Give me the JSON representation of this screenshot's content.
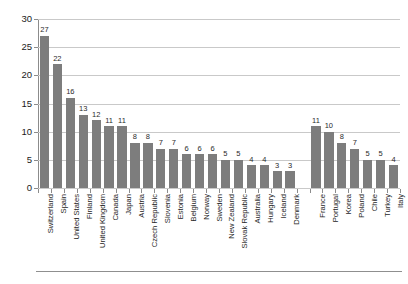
{
  "chart_data": {
    "type": "bar",
    "title": "",
    "subtitle": "",
    "xlabel": "",
    "ylabel": "",
    "ylim": [
      0,
      30
    ],
    "ytick_labels": [
      "0",
      "5",
      "10",
      "15",
      "20",
      "25",
      "30"
    ],
    "ytick_values": [
      0,
      5,
      10,
      15,
      20,
      25,
      30
    ],
    "grid": true,
    "legend": "none",
    "bar_color": "#7d7d7d",
    "gridline_color": "#c9c9c9",
    "axis_color": "#8c8c8c",
    "categories": [
      "Switzerland",
      "Spain",
      "United States",
      "Finland",
      "United Kingdom",
      "Canada",
      "Japan",
      "Austria",
      "Czech Republic",
      "Slovenia",
      "Estonia",
      "Belgium",
      "Norway",
      "Sweden",
      "New Zealand",
      "Slovak Republic",
      "Australia",
      "Hungary",
      "Iceland",
      "Denmark",
      "France",
      "Portugal",
      "Korea",
      "Poland",
      "Chile",
      "Turkey",
      "Italy"
    ],
    "values": [
      27,
      22,
      16,
      13,
      12,
      11,
      11,
      8,
      8,
      7,
      7,
      6,
      6,
      6,
      5,
      5,
      4,
      4,
      3,
      3,
      11,
      10,
      8,
      7,
      5,
      5,
      4
    ],
    "data_labels": [
      "27",
      "22",
      "16",
      "13",
      "12",
      "11",
      "11",
      "8",
      "8",
      "7",
      "7",
      "6",
      "6",
      "6",
      "5",
      "5",
      "4",
      "4",
      "3",
      "3",
      "11",
      "10",
      "8",
      "7",
      "5",
      "5",
      "4"
    ],
    "group_break_after_index": 19
  }
}
